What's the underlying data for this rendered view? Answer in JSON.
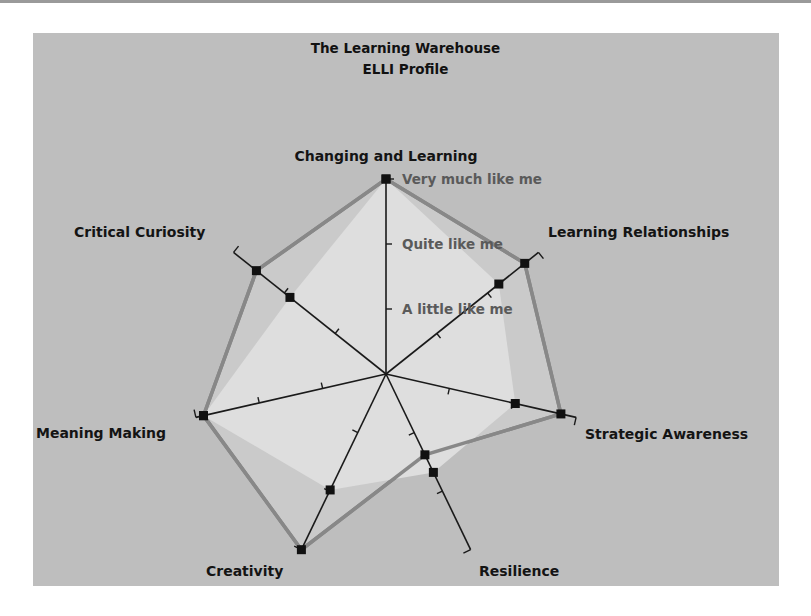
{
  "chart_data": {
    "type": "radar",
    "title": "The Learning Warehouse",
    "subtitle": "ELLI Profile",
    "categories": [
      "Changing and Learning",
      "Learning Relationships",
      "Strategic Awareness",
      "Resilience",
      "Creativity",
      "Meaning Making",
      "Critical Curiosity"
    ],
    "scale_labels": [
      "A little like me",
      "Quite like me",
      "Very much like me"
    ],
    "range": [
      0,
      1
    ],
    "series": [
      {
        "name": "Profile A (outer)",
        "values": [
          1.0,
          0.91,
          0.92,
          0.46,
          1.0,
          0.96,
          0.85
        ],
        "fill": "#cacaca",
        "stroke": "#888888",
        "markers": true
      },
      {
        "name": "Profile B (inner)",
        "values": [
          1.0,
          0.74,
          0.68,
          0.56,
          0.66,
          0.96,
          0.63
        ],
        "fill": "#dedede",
        "stroke": "none",
        "markers": true
      }
    ],
    "grid": false,
    "legend": "none"
  },
  "colors": {
    "panel_bg": "#bebebe",
    "axis": "#1a1a1a",
    "marker": "#111111"
  }
}
